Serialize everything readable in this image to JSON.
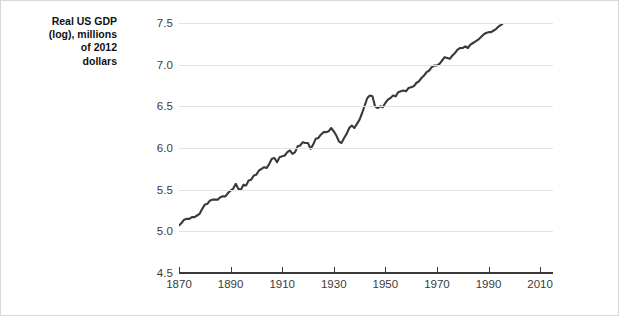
{
  "chart_data": {
    "type": "line",
    "title": "",
    "subtitle": "",
    "xlabel": "",
    "ylabel": "Real US GDP (log), millions of 2012 dollars",
    "ylabel_lines": [
      "Real US GDP",
      "(log), millions",
      "of 2012",
      "dollars"
    ],
    "xlim": [
      1870,
      2015
    ],
    "ylim": [
      4.5,
      7.5
    ],
    "yticks": [
      "7.5",
      "7.0",
      "6.5",
      "6.0",
      "5.5",
      "5.0",
      "4.5"
    ],
    "ytick_values": [
      7.5,
      7.0,
      6.5,
      6.0,
      5.5,
      5.0,
      4.5
    ],
    "xticks": [
      "1870",
      "1890",
      "1910",
      "1930",
      "1950",
      "1970",
      "1990",
      "2010"
    ],
    "xtick_values": [
      1870,
      1890,
      1910,
      1930,
      1950,
      1970,
      1990,
      2010
    ],
    "grid": "horizontal",
    "legend": "none",
    "line_color": "#3a3a3a",
    "grid_color": "#e3e3e3",
    "axis_color": "#3a3a3a",
    "series": [
      {
        "name": "Real US GDP (log)",
        "x": [
          1870,
          1871,
          1872,
          1873,
          1874,
          1875,
          1876,
          1877,
          1878,
          1879,
          1880,
          1881,
          1882,
          1883,
          1884,
          1885,
          1886,
          1887,
          1888,
          1889,
          1890,
          1891,
          1892,
          1893,
          1894,
          1895,
          1896,
          1897,
          1898,
          1899,
          1900,
          1901,
          1902,
          1903,
          1904,
          1905,
          1906,
          1907,
          1908,
          1909,
          1910,
          1911,
          1912,
          1913,
          1914,
          1915,
          1916,
          1917,
          1918,
          1919,
          1920,
          1921,
          1922,
          1923,
          1924,
          1925,
          1926,
          1927,
          1928,
          1929,
          1930,
          1931,
          1932,
          1933,
          1934,
          1935,
          1936,
          1937,
          1938,
          1939,
          1940,
          1941,
          1942,
          1943,
          1944,
          1945,
          1946,
          1947,
          1948,
          1949,
          1950,
          1951,
          1952,
          1953,
          1954,
          1955,
          1956,
          1957,
          1958,
          1959,
          1960,
          1961,
          1962,
          1963,
          1964,
          1965,
          1966,
          1967,
          1968,
          1969,
          1970,
          1971,
          1972,
          1973,
          1974,
          1975,
          1976,
          1977,
          1978,
          1979,
          1980,
          1981,
          1982,
          1983,
          1984,
          1985,
          1986,
          1987,
          1988,
          1989,
          1990,
          1991,
          1992,
          1993,
          1994,
          1995,
          1996,
          1997,
          1998,
          1999,
          2000,
          2001,
          2002,
          2003,
          2004,
          2005,
          2006,
          2007,
          2008,
          2009,
          2010,
          2011,
          2012,
          2013,
          2014,
          2015
        ],
        "values": [
          5.07,
          5.1,
          5.14,
          5.15,
          5.15,
          5.17,
          5.17,
          5.19,
          5.21,
          5.27,
          5.32,
          5.33,
          5.37,
          5.38,
          5.38,
          5.38,
          5.41,
          5.42,
          5.42,
          5.46,
          5.49,
          5.51,
          5.57,
          5.51,
          5.5,
          5.56,
          5.55,
          5.61,
          5.62,
          5.67,
          5.68,
          5.73,
          5.75,
          5.77,
          5.76,
          5.81,
          5.87,
          5.88,
          5.83,
          5.89,
          5.9,
          5.91,
          5.95,
          5.97,
          5.93,
          5.95,
          6.02,
          6.03,
          6.07,
          6.06,
          6.06,
          5.99,
          6.04,
          6.11,
          6.12,
          6.16,
          6.19,
          6.19,
          6.2,
          6.24,
          6.2,
          6.15,
          6.08,
          6.06,
          6.12,
          6.17,
          6.24,
          6.27,
          6.24,
          6.29,
          6.34,
          6.42,
          6.51,
          6.6,
          6.63,
          6.62,
          6.5,
          6.48,
          6.5,
          6.49,
          6.54,
          6.58,
          6.6,
          6.63,
          6.62,
          6.67,
          6.68,
          6.69,
          6.68,
          6.72,
          6.73,
          6.74,
          6.78,
          6.8,
          6.84,
          6.87,
          6.91,
          6.93,
          6.97,
          6.99,
          6.99,
          7.01,
          7.05,
          7.09,
          7.08,
          7.07,
          7.11,
          7.14,
          7.18,
          7.2,
          7.2,
          7.22,
          7.2,
          7.24,
          7.28,
          7.31,
          7.34,
          7.37,
          7.41,
          7.44,
          7.45,
          7.45,
          7.48,
          7.5,
          7.54,
          7.56,
          7.6,
          7.64,
          7.68,
          7.72,
          7.75,
          7.76,
          7.78,
          7.81,
          7.85,
          7.88,
          7.91,
          7.93,
          7.92,
          7.89,
          7.92,
          7.94,
          7.97,
          7.99,
          8.01,
          8.04
        ],
        "values_plotted": [
          5.07,
          5.1,
          5.14,
          5.15,
          5.15,
          5.17,
          5.17,
          5.19,
          5.21,
          5.27,
          5.32,
          5.33,
          5.37,
          5.38,
          5.38,
          5.38,
          5.41,
          5.42,
          5.42,
          5.46,
          5.49,
          5.51,
          5.57,
          5.51,
          5.5,
          5.56,
          5.55,
          5.61,
          5.62,
          5.67,
          5.68,
          5.73,
          5.75,
          5.77,
          5.76,
          5.81,
          5.87,
          5.88,
          5.83,
          5.89,
          5.9,
          5.91,
          5.95,
          5.97,
          5.93,
          5.95,
          6.02,
          6.03,
          6.07,
          6.06,
          6.06,
          5.99,
          6.04,
          6.11,
          6.12,
          6.16,
          6.19,
          6.19,
          6.2,
          6.24,
          6.2,
          6.15,
          6.08,
          6.06,
          6.12,
          6.17,
          6.24,
          6.27,
          6.24,
          6.29,
          6.34,
          6.42,
          6.51,
          6.6,
          6.63,
          6.62,
          6.5,
          6.48,
          6.5,
          6.49,
          6.54,
          6.58,
          6.6,
          6.63,
          6.62,
          6.67,
          6.68,
          6.69,
          6.68,
          6.72,
          6.73,
          6.74,
          6.78,
          6.8,
          6.84,
          6.87,
          6.91,
          6.93,
          6.97,
          6.99,
          6.99,
          7.01,
          7.05,
          7.09,
          7.08,
          7.07,
          7.11,
          7.14,
          7.18,
          7.2,
          7.2,
          7.22,
          7.2,
          7.24,
          7.26,
          7.28,
          7.3,
          7.33,
          7.36,
          7.38,
          7.39,
          7.39,
          7.41,
          7.43,
          7.46,
          7.48,
          7.51,
          7.54,
          7.57,
          7.6,
          7.63,
          7.63,
          7.65,
          7.67,
          7.7,
          7.73,
          7.75,
          7.77,
          7.76,
          7.74,
          7.76,
          7.78,
          7.8,
          7.82,
          7.84,
          7.86
        ]
      }
    ],
    "annotations": [
      {
        "label": "Great Depression trough",
        "year": 1933
      },
      {
        "label": "World War II peak",
        "year": 1944
      },
      {
        "label": "Great Recession",
        "year": 2009
      }
    ]
  }
}
